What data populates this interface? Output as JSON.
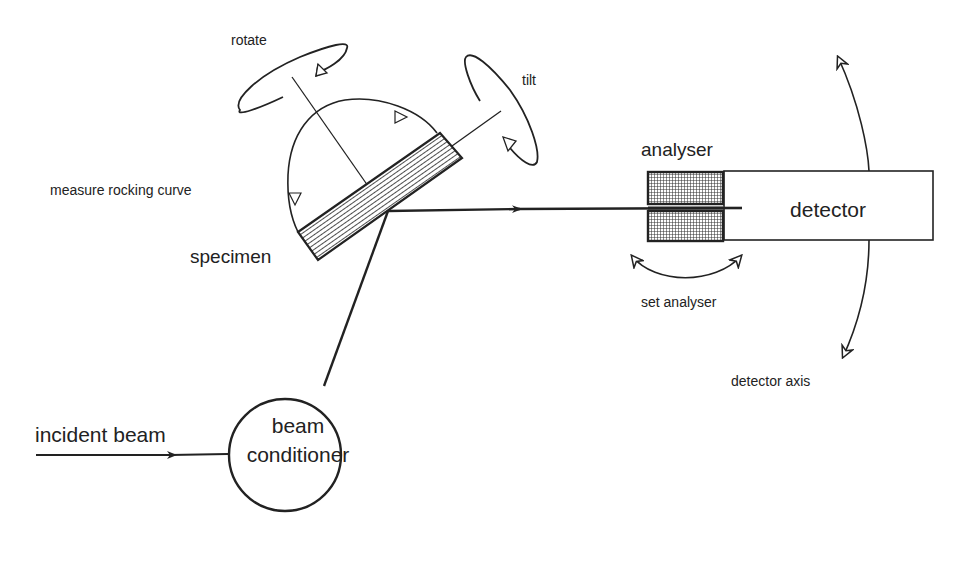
{
  "diagram": {
    "type": "x-ray double-crystal diffractometer schematic",
    "labels": {
      "rotate": "rotate",
      "tilt": "tilt",
      "measure_rocking_curve": "measure rocking curve",
      "specimen": "specimen",
      "analyser": "analyser",
      "detector": "detector",
      "set_analyser": "set analyser",
      "detector_axis": "detector axis",
      "incident_beam": "incident beam",
      "beam_conditioner_line1": "beam",
      "beam_conditioner_line2": "conditioner"
    },
    "components": [
      {
        "id": "beam-conditioner",
        "shape": "circle",
        "label": "beam conditioner"
      },
      {
        "id": "specimen",
        "shape": "hatched-rectangle",
        "label": "specimen"
      },
      {
        "id": "analyser",
        "shape": "cross-hatched-block",
        "label": "analyser"
      },
      {
        "id": "detector",
        "shape": "rectangle",
        "label": "detector"
      }
    ],
    "connections": [
      {
        "from": "incident beam",
        "to": "beam-conditioner",
        "arrow": true
      },
      {
        "from": "beam-conditioner",
        "to": "specimen",
        "arrow": false
      },
      {
        "from": "specimen",
        "to": "analyser",
        "arrow": true
      },
      {
        "from": "analyser",
        "to": "detector",
        "arrow": false
      }
    ],
    "motions": [
      {
        "label": "rotate",
        "kind": "rotation ellipse"
      },
      {
        "label": "tilt",
        "kind": "rotation ellipse"
      },
      {
        "label": "measure rocking curve",
        "kind": "arc arrow"
      },
      {
        "label": "set analyser",
        "kind": "double-headed arc"
      },
      {
        "label": "detector axis",
        "kind": "double-headed arc"
      }
    ],
    "colors": {
      "stroke": "#222222",
      "background": "#ffffff"
    }
  }
}
